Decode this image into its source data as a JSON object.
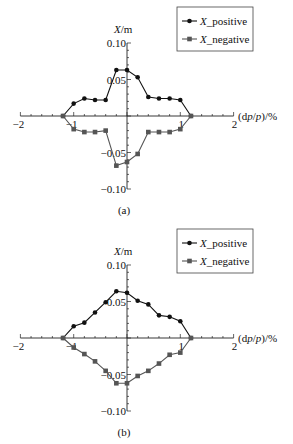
{
  "chart_data": [
    {
      "type": "line",
      "panel_label": "(a)",
      "title": "",
      "xlabel": "(dp/p)/%",
      "ylabel": "X/m",
      "xlim": [
        -2,
        2
      ],
      "ylim": [
        -0.1,
        0.1
      ],
      "xticks": [
        -2,
        -1,
        1,
        2
      ],
      "xtick_labels": [
        "−2",
        "−1",
        "1",
        "2"
      ],
      "yticks": [
        0.1,
        0.05,
        -0.05,
        -0.1
      ],
      "ytick_labels": [
        "0.10",
        "0.05",
        "−0.05",
        "−0.10"
      ],
      "grid": false,
      "legend_position": "upper right",
      "x": [
        -1.2,
        -1.0,
        -0.8,
        -0.6,
        -0.4,
        -0.2,
        0.0,
        0.2,
        0.4,
        0.6,
        0.8,
        1.0,
        1.2
      ],
      "series": [
        {
          "name": "X_positive",
          "marker": "circle",
          "color": "#111111",
          "values": [
            0.0,
            0.017,
            0.024,
            0.022,
            0.022,
            0.063,
            0.063,
            0.053,
            0.026,
            0.024,
            0.024,
            0.022,
            0.0
          ]
        },
        {
          "name": "X_negative",
          "marker": "square",
          "color": "#555555",
          "values": [
            0.0,
            -0.018,
            -0.022,
            -0.022,
            -0.02,
            -0.068,
            -0.063,
            -0.052,
            -0.022,
            -0.022,
            -0.022,
            -0.018,
            0.0
          ]
        }
      ]
    },
    {
      "type": "line",
      "panel_label": "(b)",
      "title": "",
      "xlabel": "(dp/p)/%",
      "ylabel": "X/m",
      "xlim": [
        -2,
        2
      ],
      "ylim": [
        -0.1,
        0.1
      ],
      "xticks": [
        -2,
        -1,
        1,
        2
      ],
      "xtick_labels": [
        "−2",
        "−1",
        "1",
        "2"
      ],
      "yticks": [
        0.1,
        0.05,
        -0.05,
        -0.1
      ],
      "ytick_labels": [
        "0.10",
        "0.05",
        "−0.05",
        "−0.10"
      ],
      "grid": false,
      "legend_position": "upper right",
      "x": [
        -1.2,
        -1.0,
        -0.8,
        -0.6,
        -0.4,
        -0.2,
        0.0,
        0.2,
        0.4,
        0.6,
        0.8,
        1.0,
        1.2
      ],
      "series": [
        {
          "name": "X_positive",
          "marker": "circle",
          "color": "#111111",
          "values": [
            0.0,
            0.016,
            0.021,
            0.035,
            0.049,
            0.064,
            0.062,
            0.051,
            0.046,
            0.031,
            0.029,
            0.023,
            0.0
          ]
        },
        {
          "name": "X_negative",
          "marker": "square",
          "color": "#555555",
          "values": [
            0.0,
            -0.013,
            -0.022,
            -0.032,
            -0.045,
            -0.062,
            -0.062,
            -0.052,
            -0.045,
            -0.035,
            -0.023,
            -0.02,
            0.0
          ]
        }
      ]
    }
  ]
}
